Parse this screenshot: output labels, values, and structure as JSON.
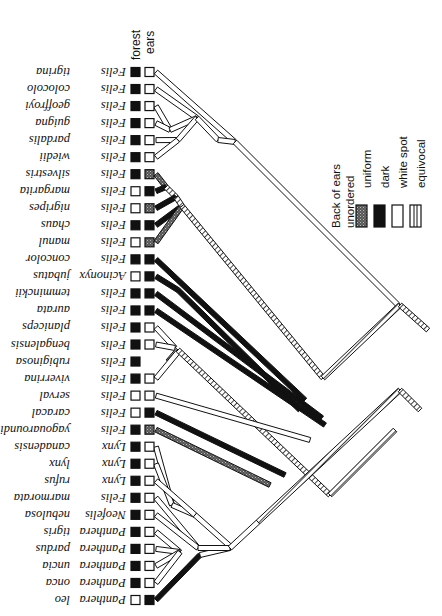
{
  "figure": {
    "type": "phylogenetic-tree",
    "orientation": "rotated-180-labels",
    "column_headers": {
      "forest": "forest",
      "ears": "ears"
    },
    "legend": {
      "title_line1": "Back of ears",
      "title_line2": "unordered",
      "items": [
        {
          "label": "uniform",
          "pattern": "stipple"
        },
        {
          "label": "dark",
          "pattern": "solid-black"
        },
        {
          "label": "white spot",
          "pattern": "white"
        },
        {
          "label": "equivocal",
          "pattern": "hatched"
        }
      ]
    },
    "taxa": [
      {
        "genus": "Felis",
        "species": "tigrina",
        "forest": "filled",
        "ears": "white"
      },
      {
        "genus": "Felis",
        "species": "colocolo",
        "forest": "filled",
        "ears": "white"
      },
      {
        "genus": "Felis",
        "species": "geoffroyi",
        "forest": "filled",
        "ears": "white"
      },
      {
        "genus": "Felis",
        "species": "guigna",
        "forest": "filled",
        "ears": "white"
      },
      {
        "genus": "Felis",
        "species": "pardalis",
        "forest": "filled",
        "ears": "white"
      },
      {
        "genus": "Felis",
        "species": "wiedii",
        "forest": "filled",
        "ears": "white"
      },
      {
        "genus": "Felis",
        "species": "silvestris",
        "forest": "filled",
        "ears": "stipple"
      },
      {
        "genus": "Felis",
        "species": "margarita",
        "forest": "empty",
        "ears": "dark"
      },
      {
        "genus": "Felis",
        "species": "nigripes",
        "forest": "empty",
        "ears": "stipple"
      },
      {
        "genus": "Felis",
        "species": "chaus",
        "forest": "filled",
        "ears": "dark"
      },
      {
        "genus": "Felis",
        "species": "manul",
        "forest": "empty",
        "ears": "stipple"
      },
      {
        "genus": "Felis",
        "species": "concolor",
        "forest": "filled",
        "ears": "dark"
      },
      {
        "genus": "Acinonyx",
        "species": "jubatus",
        "forest": "empty",
        "ears": "dark"
      },
      {
        "genus": "Felis",
        "species": "temminckii",
        "forest": "filled",
        "ears": "dark"
      },
      {
        "genus": "Felis",
        "species": "aurata",
        "forest": "filled",
        "ears": "dark"
      },
      {
        "genus": "Felis",
        "species": "planiceps",
        "forest": "filled",
        "ears": "white"
      },
      {
        "genus": "Felis",
        "species": "bengalensis",
        "forest": "filled",
        "ears": "white"
      },
      {
        "genus": "Felis",
        "species": "rubiginosa",
        "forest": "filled",
        "ears": "none"
      },
      {
        "genus": "Felis",
        "species": "viverrina",
        "forest": "filled",
        "ears": "white"
      },
      {
        "genus": "Felis",
        "species": "serval",
        "forest": "empty",
        "ears": "white"
      },
      {
        "genus": "Felis",
        "species": "caracal",
        "forest": "empty",
        "ears": "dark"
      },
      {
        "genus": "Felis",
        "species": "yagouaroundi",
        "forest": "filled",
        "ears": "stipple"
      },
      {
        "genus": "Lynx",
        "species": "canadensis",
        "forest": "filled",
        "ears": "white"
      },
      {
        "genus": "Lynx",
        "species": "lynx",
        "forest": "filled",
        "ears": "white"
      },
      {
        "genus": "Lynx",
        "species": "rufus",
        "forest": "filled",
        "ears": "white"
      },
      {
        "genus": "Felis",
        "species": "marmorata",
        "forest": "filled",
        "ears": "white"
      },
      {
        "genus": "Neofelis",
        "species": "nebulosa",
        "forest": "filled",
        "ears": "white"
      },
      {
        "genus": "Panthera",
        "species": "tigris",
        "forest": "filled",
        "ears": "white"
      },
      {
        "genus": "Panthera",
        "species": "pardus",
        "forest": "filled",
        "ears": "white"
      },
      {
        "genus": "Panthera",
        "species": "uncia",
        "forest": "filled",
        "ears": "white"
      },
      {
        "genus": "Panthera",
        "species": "onca",
        "forest": "filled",
        "ears": "white"
      },
      {
        "genus": "Panthera",
        "species": "leo",
        "forest": "empty",
        "ears": "dark"
      }
    ]
  }
}
